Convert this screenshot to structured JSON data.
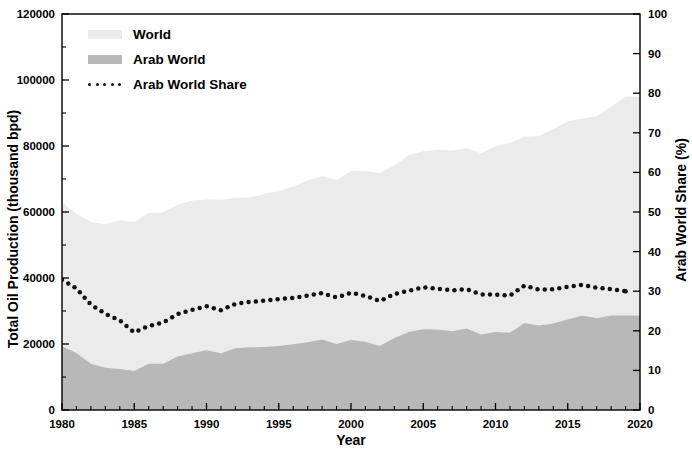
{
  "chart_data": {
    "type": "area",
    "title": "",
    "xlabel": "Year",
    "ylabel": "Total Oil Production (thousand bpd)",
    "ylabel_right": "Arab World Share (%)",
    "xlim": [
      1980,
      2020
    ],
    "ylim": [
      0,
      120000
    ],
    "ylim_right": [
      0,
      100
    ],
    "xticks": [
      1980,
      1985,
      1990,
      1995,
      2000,
      2005,
      2010,
      2015,
      2020
    ],
    "xtick_labels": [
      "1980",
      "1985",
      "1990",
      "1995",
      "2000",
      "2005",
      "2010",
      "2015",
      "2020"
    ],
    "xminor_step": 1,
    "yticks": [
      0,
      20000,
      40000,
      60000,
      80000,
      100000,
      120000
    ],
    "ytick_labels": [
      "0",
      "20000",
      "40000",
      "60000",
      "80000",
      "100000",
      "120000"
    ],
    "yticks_right": [
      0,
      10,
      20,
      30,
      40,
      50,
      60,
      70,
      80,
      90,
      100
    ],
    "ytick_labels_right": [
      "0",
      "10",
      "20",
      "30",
      "40",
      "50",
      "60",
      "70",
      "80",
      "90",
      "100"
    ],
    "grid": false,
    "legend_position": "top-left",
    "colors": {
      "world_fill": "#ebebeb",
      "arab_fill": "#b8b8b8",
      "share_line": "#111111",
      "axis": "#000000",
      "background": "#ffffff"
    },
    "x": [
      1980,
      1981,
      1982,
      1983,
      1984,
      1985,
      1986,
      1987,
      1988,
      1989,
      1990,
      1991,
      1992,
      1993,
      1994,
      1995,
      1996,
      1997,
      1998,
      1999,
      2000,
      2001,
      2002,
      2003,
      2004,
      2005,
      2006,
      2007,
      2008,
      2009,
      2010,
      2011,
      2012,
      2013,
      2014,
      2015,
      2016,
      2017,
      2018,
      2019
    ],
    "series": [
      {
        "name": "World",
        "type": "area",
        "axis": "left",
        "units": "thousand bpd",
        "values": [
          62900,
          59500,
          57000,
          56300,
          57500,
          57000,
          59700,
          59900,
          62200,
          63500,
          63800,
          63700,
          64300,
          64300,
          65500,
          66300,
          67700,
          69600,
          70800,
          69700,
          72500,
          72400,
          71800,
          74100,
          77300,
          78400,
          78800,
          78600,
          79300,
          77800,
          79900,
          80900,
          82800,
          83000,
          85100,
          87400,
          88300,
          89000,
          92000,
          95000
        ]
      },
      {
        "name": "Arab World",
        "type": "area",
        "axis": "left",
        "units": "thousand bpd",
        "values": [
          19300,
          17300,
          14000,
          12800,
          12400,
          11800,
          14000,
          14000,
          16200,
          17200,
          18100,
          17200,
          18700,
          19000,
          19100,
          19400,
          19900,
          20500,
          21400,
          20000,
          21200,
          20700,
          19400,
          21800,
          23600,
          24500,
          24400,
          23900,
          24700,
          22900,
          23600,
          23400,
          26400,
          25600,
          26200,
          27400,
          28600,
          27800,
          28600,
          28600
        ]
      },
      {
        "name": "Arab World Share",
        "type": "line",
        "style": "dotted",
        "axis": "right",
        "units": "%",
        "values": [
          32.9,
          30.7,
          26.6,
          24.3,
          22.6,
          19.6,
          21.2,
          22.1,
          24.2,
          25.3,
          26.2,
          25.2,
          26.8,
          27.3,
          27.6,
          28.0,
          28.3,
          28.9,
          29.5,
          28.4,
          29.6,
          28.8,
          27.5,
          29.3,
          30.1,
          31.0,
          30.6,
          30.2,
          30.5,
          29.2,
          29.1,
          28.9,
          31.4,
          30.4,
          30.5,
          31.1,
          31.6,
          30.9,
          30.5,
          30.0
        ]
      }
    ]
  },
  "legend": {
    "items": [
      {
        "label": "World",
        "swatch": "world-swatch"
      },
      {
        "label": "Arab World",
        "swatch": "arab-swatch"
      },
      {
        "label": "Arab World Share",
        "swatch": "dotted-line-swatch"
      }
    ]
  },
  "axes": {
    "left_title": "Total Oil Production (thousand bpd)",
    "right_title": "Arab World Share (%)",
    "bottom_title": "Year"
  }
}
